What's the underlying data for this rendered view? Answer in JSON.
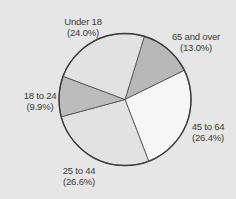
{
  "chart_data": {
    "type": "pie",
    "title": "",
    "start_angle_deg": 17,
    "direction": "clockwise",
    "slices": [
      {
        "label": "65 and over",
        "value": 13.0,
        "pct_text": "(13.0%)",
        "color": "#b8b8b8"
      },
      {
        "label": "45 to 64",
        "value": 26.4,
        "pct_text": "(26.4%)",
        "color": "#f6f6f6"
      },
      {
        "label": "25 to 44",
        "value": 26.6,
        "pct_text": "(26.6%)",
        "color": "#e2e2e2"
      },
      {
        "label": "18 to 24",
        "value": 9.9,
        "pct_text": "(9.9%)",
        "color": "#bcbcbc"
      },
      {
        "label": "Under 18",
        "value": 24.0,
        "pct_text": "(24.0%)",
        "color": "#e2e2e2"
      }
    ]
  },
  "labels": {
    "s0": {
      "name": "65 and over",
      "pct": "(13.0%)"
    },
    "s1": {
      "name": "45 to 64",
      "pct": "(26.4%)"
    },
    "s2": {
      "name": "25 to 44",
      "pct": "(26.6%)"
    },
    "s3": {
      "name": "18 to 24",
      "pct": "(9.9%)"
    },
    "s4": {
      "name": "Under 18",
      "pct": "(24.0%)"
    }
  },
  "colors": {
    "background": "#e6e6e6",
    "outline": "#3c3c3c"
  }
}
